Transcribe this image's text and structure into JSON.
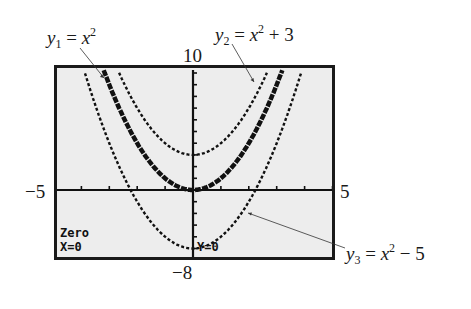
{
  "figure": {
    "window": {
      "xmin": -5,
      "xmax": 5,
      "ymin": -8,
      "ymax": 10
    },
    "axis_labels": {
      "ymax": "10",
      "ymin": "−8",
      "xmin": "−5",
      "xmax": "5"
    },
    "screen_text": {
      "line1": "Zero",
      "line2": "X=0",
      "line3": "Y=0"
    },
    "equations": [
      {
        "name": "y",
        "sub": "1",
        "rhs_base": "x",
        "rhs_exp": "2",
        "rhs_tail": ""
      },
      {
        "name": "y",
        "sub": "2",
        "rhs_base": "x",
        "rhs_exp": "2",
        "rhs_tail": " + 3"
      },
      {
        "name": "y",
        "sub": "3",
        "rhs_base": "x",
        "rhs_exp": "2",
        "rhs_tail": " − 5"
      }
    ],
    "colors": {
      "screen_bg": "#ededed",
      "ink": "#111111",
      "frame": "#1a1a1a"
    }
  },
  "chart_data": {
    "type": "line",
    "title": "",
    "xlabel": "",
    "ylabel": "",
    "xlim": [
      -5,
      5
    ],
    "ylim": [
      -8,
      10
    ],
    "grid": false,
    "series": [
      {
        "name": "y1 = x^2",
        "formula": "x^2",
        "style": "thick",
        "x": [
          -3.2,
          -3,
          -2.5,
          -2,
          -1.5,
          -1,
          -0.5,
          0,
          0.5,
          1,
          1.5,
          2,
          2.5,
          3,
          3.2
        ],
        "values": [
          10.24,
          9,
          6.25,
          4,
          2.25,
          1,
          0.25,
          0,
          0.25,
          1,
          2.25,
          4,
          6.25,
          9,
          10.24
        ]
      },
      {
        "name": "y2 = x^2 + 3",
        "formula": "x^2+3",
        "style": "dotted",
        "x": [
          -2.65,
          -2.5,
          -2,
          -1.5,
          -1,
          -0.5,
          0,
          0.5,
          1,
          1.5,
          2,
          2.5,
          2.65
        ],
        "values": [
          10,
          9.25,
          7,
          5.25,
          4,
          3.25,
          3,
          3.25,
          4,
          5.25,
          7,
          9.25,
          10
        ]
      },
      {
        "name": "y3 = x^2 - 5",
        "formula": "x^2-5",
        "style": "dotted",
        "x": [
          -3.87,
          -3.5,
          -3,
          -2.5,
          -2,
          -1.5,
          -1,
          -0.5,
          0,
          0.5,
          1,
          1.5,
          2,
          2.5,
          3,
          3.5,
          3.87
        ],
        "values": [
          10,
          7.25,
          4,
          1.25,
          -1,
          -2.75,
          -4,
          -4.75,
          -5,
          -4.75,
          -4,
          -2.75,
          -1,
          1.25,
          4,
          7.25,
          10
        ]
      }
    ],
    "annotations": [
      "y1 = x^2",
      "y2 = x^2 + 3",
      "y3 = x^2 - 5",
      "Zero",
      "X=0",
      "Y=0"
    ]
  }
}
